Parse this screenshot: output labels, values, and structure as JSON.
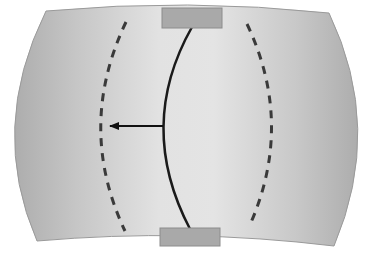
{
  "diagram": {
    "type": "membrane-deflection-schematic",
    "labels": [],
    "colors": {
      "background": "#ffffff",
      "body_edge": "#b0b0b0",
      "body_center": "#e6e6e6",
      "body_outline": "#9a9a9a",
      "clamp_fill": "#a9a9a9",
      "clamp_stroke": "#8c8c8c",
      "solid_curve": "#1a1a1a",
      "dashed_curve": "#3a3a3a",
      "arrow": "#111111"
    },
    "body": {
      "top_left": [
        46,
        11
      ],
      "top_right": [
        329,
        13
      ],
      "bottom_right": [
        334,
        246
      ],
      "bottom_left": [
        37,
        241
      ],
      "left_bulge_x": 14,
      "right_bulge_x": 359
    },
    "clamps": [
      {
        "name": "top-clamp",
        "x": 162,
        "y": 8,
        "w": 60,
        "h": 20
      },
      {
        "name": "bottom-clamp",
        "x": 160,
        "y": 228,
        "w": 60,
        "h": 18
      }
    ],
    "solid_curve": {
      "start": [
        192,
        27
      ],
      "control": [
        136,
        126
      ],
      "end": [
        190,
        229
      ]
    },
    "dashed_left": {
      "start": [
        126,
        22
      ],
      "control": [
        76,
        127
      ],
      "end": [
        125,
        231
      ]
    },
    "dashed_right": {
      "start": [
        247,
        24
      ],
      "control": [
        295,
        125
      ],
      "end": [
        249,
        227
      ]
    },
    "arrow": {
      "from": [
        163,
        126
      ],
      "to": [
        109,
        126
      ],
      "direction": "left"
    }
  }
}
